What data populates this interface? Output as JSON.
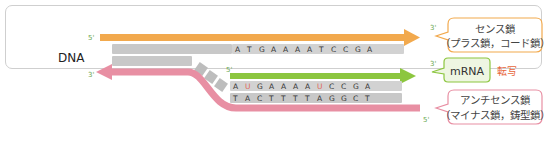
{
  "diagram": {
    "dna_label": "DNA",
    "sense_strand": {
      "label_line1": "センス鎖",
      "label_line2": "（プラス鎖，コード鎖）",
      "prime_start": "5'",
      "prime_end": "3'",
      "sequence": [
        "A",
        "T",
        "G",
        "A",
        "A",
        "A",
        "A",
        "T",
        "C",
        "C",
        "G",
        "A"
      ],
      "color": "#f2a94d"
    },
    "antisense_strand": {
      "label_line1": "アンチセンス鎖",
      "label_line2": "（マイナス鎖，鋳型鎖）",
      "prime_start": "3'",
      "prime_end": "5'",
      "sequence": [
        "T",
        "A",
        "C",
        "T",
        "T",
        "T",
        "T",
        "A",
        "G",
        "G",
        "C",
        "T"
      ],
      "color": "#e88fa3"
    },
    "mrna": {
      "label": "mRNA",
      "prime_start": "5'",
      "prime_end": "3'",
      "sequence": [
        "A",
        "U",
        "G",
        "A",
        "A",
        "A",
        "A",
        "U",
        "C",
        "C",
        "G",
        "A"
      ],
      "color": "#8cc63f"
    },
    "process_label": "転写",
    "colors": {
      "sense": "#f2a94d",
      "antisense": "#e88fa3",
      "mrna": "#8cc63f",
      "process_text": "#e8663a",
      "prime_text": "#6aa84f",
      "uracil_text": "#e06a5a",
      "base_fill": "#c8c8c8",
      "sense_callout_border": "#f2a94d",
      "mrna_callout_border": "#8cc63f",
      "antisense_callout_border": "#e88fa3"
    }
  }
}
